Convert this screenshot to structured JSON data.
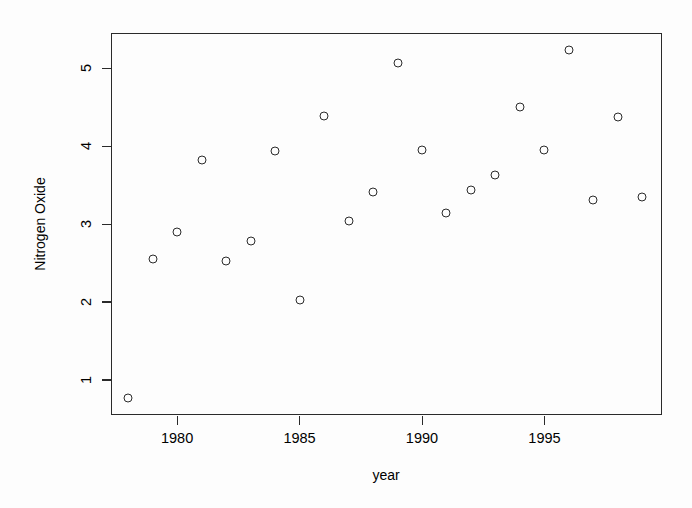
{
  "chart_data": {
    "type": "scatter",
    "title": "",
    "xlabel": "year",
    "ylabel": "Nitrogen Oxide",
    "xlim": [
      1977.3,
      1999.8
    ],
    "ylim": [
      0.55,
      5.45
    ],
    "grid": false,
    "legend": null,
    "marker": "open-circle",
    "x_ticks": [
      1980,
      1985,
      1990,
      1995
    ],
    "y_ticks": [
      1,
      2,
      3,
      4,
      5
    ],
    "x_tick_labels": [
      "1980",
      "1985",
      "1990",
      "1995"
    ],
    "y_tick_labels": [
      "1",
      "2",
      "3",
      "4",
      "5"
    ],
    "x": [
      1978,
      1979,
      1980,
      1981,
      1982,
      1983,
      1984,
      1985,
      1986,
      1987,
      1988,
      1989,
      1990,
      1991,
      1992,
      1993,
      1994,
      1995,
      1996,
      1997,
      1998,
      1999
    ],
    "y": [
      0.77,
      2.55,
      2.9,
      3.82,
      2.53,
      2.78,
      3.93,
      2.03,
      4.38,
      3.04,
      3.41,
      5.07,
      3.95,
      3.14,
      3.44,
      3.63,
      4.5,
      3.95,
      5.23,
      3.31,
      4.37,
      3.34
    ],
    "points": [
      {
        "year": 1978,
        "value": 0.77
      },
      {
        "year": 1979,
        "value": 2.55
      },
      {
        "year": 1980,
        "value": 2.9
      },
      {
        "year": 1981,
        "value": 3.82
      },
      {
        "year": 1982,
        "value": 2.53
      },
      {
        "year": 1983,
        "value": 2.78
      },
      {
        "year": 1984,
        "value": 3.93
      },
      {
        "year": 1985,
        "value": 2.03
      },
      {
        "year": 1986,
        "value": 4.38
      },
      {
        "year": 1987,
        "value": 3.04
      },
      {
        "year": 1988,
        "value": 3.41
      },
      {
        "year": 1989,
        "value": 5.07
      },
      {
        "year": 1990,
        "value": 3.95
      },
      {
        "year": 1991,
        "value": 3.14
      },
      {
        "year": 1992,
        "value": 3.44
      },
      {
        "year": 1993,
        "value": 3.63
      },
      {
        "year": 1994,
        "value": 4.5
      },
      {
        "year": 1995,
        "value": 3.95
      },
      {
        "year": 1996,
        "value": 5.23
      },
      {
        "year": 1997,
        "value": 3.31
      },
      {
        "year": 1998,
        "value": 4.37
      },
      {
        "year": 1999,
        "value": 3.34
      }
    ]
  },
  "axes": {
    "x_title": "year",
    "y_title": "Nitrogen Oxide"
  },
  "colors": {
    "foreground": "#2a2a2a",
    "background": "#fdfdfd",
    "marker_stroke": "#2b2b2b"
  }
}
